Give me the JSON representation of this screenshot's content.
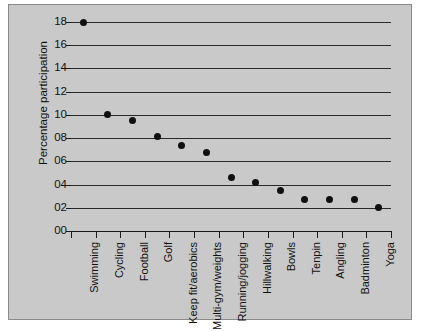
{
  "chart_data": {
    "type": "scatter",
    "title": "",
    "xlabel": "",
    "ylabel": "Percentage participation",
    "categories": [
      "Swimming",
      "Cycling",
      "Football",
      "Golf",
      "Keep fit/aerobics",
      "Multi-gym/weights",
      "Running/jogging",
      "Hillwalking",
      "Bowls",
      "Tenpin",
      "Angling",
      "Badminton",
      "Yoga"
    ],
    "values": [
      18.0,
      10.0,
      9.5,
      8.1,
      7.4,
      6.8,
      4.6,
      4.2,
      3.5,
      2.7,
      2.7,
      2.7,
      2.0
    ],
    "ylim": [
      0,
      18
    ],
    "yticks": [
      0,
      2,
      4,
      6,
      8,
      10,
      12,
      14,
      16,
      18
    ],
    "ytick_labels": [
      "00",
      "02",
      "04",
      "06",
      "08",
      "10",
      "12",
      "14",
      "16",
      "18"
    ],
    "grid": true,
    "legend": false,
    "marker": "filled-circle",
    "marker_color": "#101010",
    "plot_background": "#c9c9c9",
    "gridline_color": "#2a2a2a"
  }
}
